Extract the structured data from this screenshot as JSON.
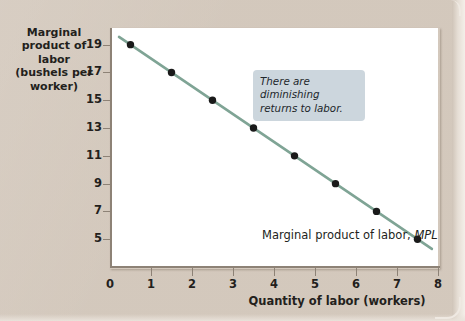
{
  "figure": {
    "background_color": "#d8cec3",
    "plot_background_color": "#ffffff"
  },
  "chart_data": {
    "type": "line",
    "title": "",
    "xlabel": "Quantity of labor (workers)",
    "ylabel": "Marginal product of labor (bushels per worker)",
    "ylabel_lines": [
      "Marginal",
      "product of labor",
      "(bushels per",
      "worker)"
    ],
    "x": [
      0.5,
      1.5,
      2.5,
      3.5,
      4.5,
      5.5,
      6.5,
      7.5
    ],
    "values": [
      19,
      17,
      15,
      13,
      11,
      9,
      7,
      5
    ],
    "series": [
      {
        "name": "Marginal product of labor, MPL",
        "values": [
          19,
          17,
          15,
          13,
          11,
          9,
          7,
          5
        ]
      }
    ],
    "xlim": [
      0,
      8
    ],
    "ylim": [
      3,
      20.2
    ],
    "xticks": [
      0,
      1,
      2,
      3,
      4,
      5,
      6,
      7,
      8
    ],
    "xtick_labels": [
      "0",
      "1",
      "2",
      "3",
      "4",
      "5",
      "6",
      "7",
      "8"
    ],
    "yticks": [
      19,
      17,
      15,
      13,
      11,
      9,
      7,
      5
    ],
    "ytick_labels": [
      "19",
      "17",
      "15",
      "13",
      "11",
      "9",
      "7",
      "5"
    ],
    "grid": false,
    "legend": "none",
    "line_color": "#7fa495",
    "marker_color": "#1a1a1a",
    "marker_shape": "circle",
    "annotations": [
      {
        "text": "There are diminishing returns to labor.",
        "lines": [
          "There are diminishing",
          "returns to labor."
        ],
        "style": "italic",
        "box_color": "#ccd6dd",
        "x": 4.0,
        "y": 20.0
      },
      {
        "text": "Marginal product of labor, MPL",
        "text_plain": "Marginal product of labor,",
        "text_italic": "MPL",
        "style": "series-label",
        "x": 5.2,
        "y": 4.0
      }
    ]
  },
  "axis_titles": {
    "x": "Quantity of labor (workers)",
    "y_lines": [
      "Marginal",
      "product of labor",
      "(bushels per",
      "worker)"
    ]
  }
}
